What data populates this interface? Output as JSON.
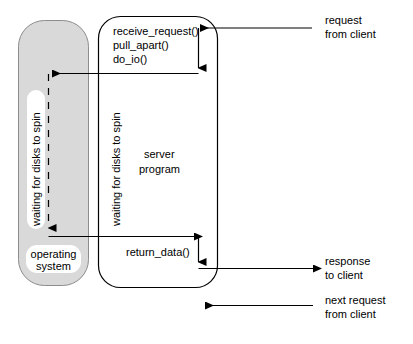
{
  "diagram": {
    "os_box": {
      "label_line1": "operating",
      "label_line2": "system",
      "wait_label": "waiting for disks to spin",
      "fill": "#d9d9d9"
    },
    "server_box": {
      "label_line1": "server",
      "label_line2": "program",
      "wait_label": "waiting for disks to spin",
      "fill": "#ffffff",
      "calls": [
        "receive_request()",
        "pull_apart()",
        "do_io()"
      ],
      "return_call": "return_data()"
    },
    "annotations": [
      {
        "line1": "request",
        "line2": "from client"
      },
      {
        "line1": "response",
        "line2": "to client"
      },
      {
        "line1": "next request",
        "line2": "from client"
      }
    ],
    "colors": {
      "stroke": "#000000",
      "os_fill": "#d9d9d9",
      "background": "#ffffff"
    }
  }
}
